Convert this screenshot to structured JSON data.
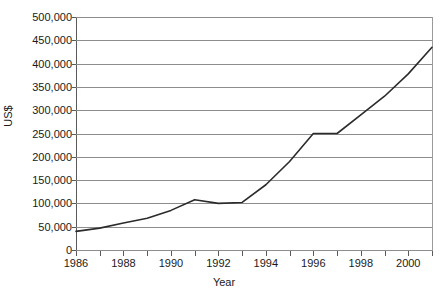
{
  "chart_data": {
    "type": "line",
    "title": "",
    "xlabel": "Year",
    "ylabel": "US$",
    "xlim": [
      1986,
      2001
    ],
    "ylim": [
      0,
      500000
    ],
    "grid": true,
    "legend": false,
    "x": [
      1986,
      1987,
      1988,
      1989,
      1990,
      1991,
      1992,
      1993,
      1994,
      1995,
      1996,
      1997,
      1998,
      1999,
      2000,
      2001
    ],
    "series": [
      {
        "name": "US$",
        "color": "#2b2b2b",
        "values": [
          40000,
          47000,
          58000,
          68000,
          85000,
          108000,
          100000,
          102000,
          140000,
          190000,
          250000,
          250000,
          290000,
          330000,
          378000,
          435000
        ]
      }
    ],
    "y_ticks": [
      0,
      50000,
      100000,
      150000,
      200000,
      250000,
      300000,
      350000,
      400000,
      450000,
      500000
    ],
    "y_tick_labels": [
      "0",
      "50,000",
      "100,000",
      "150,000",
      "200,000",
      "250,000",
      "300,000",
      "350,000",
      "400,000",
      "450,000",
      "500,000"
    ],
    "x_ticks": [
      1986,
      1987,
      1988,
      1989,
      1990,
      1991,
      1992,
      1993,
      1994,
      1995,
      1996,
      1997,
      1998,
      1999,
      2000,
      2001
    ],
    "x_tick_labels_shown": [
      "1986",
      "1988",
      "1990",
      "1992",
      "1994",
      "1996",
      "1998",
      "2000"
    ],
    "x_tick_labeled_values": [
      1986,
      1988,
      1990,
      1992,
      1994,
      1996,
      1998,
      2000
    ]
  }
}
